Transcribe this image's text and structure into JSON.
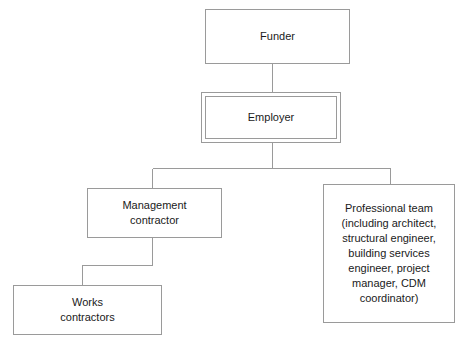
{
  "diagram": {
    "type": "organizational-hierarchy",
    "nodes": [
      {
        "id": "funder",
        "label": "Funder",
        "emphasis": "single-border",
        "x": 205,
        "y": 9,
        "width": 145,
        "height": 55
      },
      {
        "id": "employer",
        "label": "Employer",
        "emphasis": "double-border",
        "x": 201,
        "y": 92,
        "width": 140,
        "height": 51
      },
      {
        "id": "management-contractor",
        "label": "Management\ncontractor",
        "emphasis": "single-border",
        "x": 87,
        "y": 188,
        "width": 135,
        "height": 50
      },
      {
        "id": "professional-team",
        "label": "Professional team\n(including architect,\nstructural engineer,\nbuilding services\nengineer, project\nmanager, CDM\ncoordinator)",
        "emphasis": "single-border",
        "x": 323,
        "y": 184,
        "width": 132,
        "height": 139
      },
      {
        "id": "works-contractors",
        "label": "Works\ncontractors",
        "emphasis": "single-border",
        "x": 13,
        "y": 285,
        "width": 149,
        "height": 50
      }
    ],
    "edges": [
      {
        "id": "funder-to-employer",
        "from": "funder",
        "to": "employer",
        "style": "straight-vertical"
      },
      {
        "id": "employer-to-management-contractor",
        "from": "employer",
        "to": "management-contractor",
        "style": "orthogonal-branch"
      },
      {
        "id": "employer-to-professional-team",
        "from": "employer",
        "to": "professional-team",
        "style": "orthogonal-branch"
      },
      {
        "id": "management-contractor-to-works-contractors",
        "from": "management-contractor",
        "to": "works-contractors",
        "style": "stepped-elbow"
      }
    ],
    "colors": {
      "line": "#9a9a9a",
      "text": "#1a1a1a",
      "background": "#ffffff"
    }
  }
}
